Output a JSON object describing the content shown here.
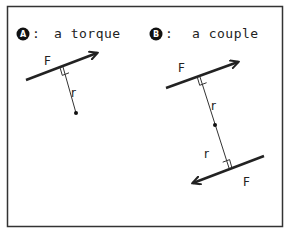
{
  "panel_a": {
    "badge": "A",
    "colon": ":",
    "title": "a torque",
    "force_label": "F",
    "radius_label": "r"
  },
  "panel_b": {
    "badge": "B",
    "colon": ":",
    "title": "a couple",
    "upper_force_label": "F",
    "upper_radius_label": "r",
    "lower_radius_label": "r",
    "lower_force_label": "F"
  },
  "colors": {
    "ink": "#222222",
    "background": "#ffffff"
  }
}
